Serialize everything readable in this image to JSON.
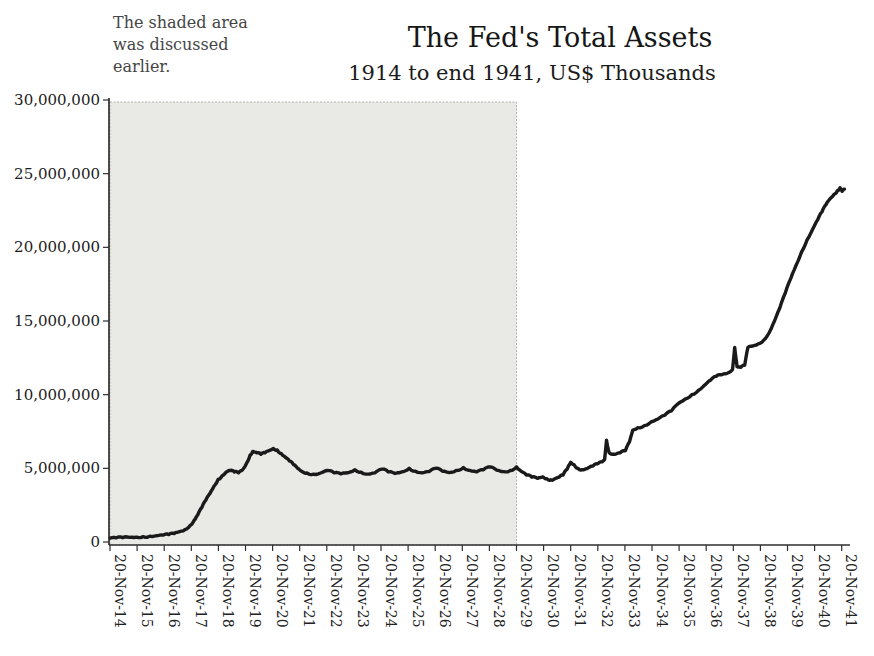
{
  "title": "The Fed's Total Assets",
  "subtitle": "1914 to end 1941, US$ Thousands",
  "annotation": {
    "lines": [
      "The shaded area",
      "was discussed",
      "earlier."
    ]
  },
  "colors": {
    "line": "#1a1a1a",
    "axis": "#2e2e2e",
    "shade_fill": "#e9e9e5",
    "shade_border": "#b3b3ad",
    "background": "#ffffff"
  },
  "chart_data": {
    "type": "line",
    "title": "The Fed's Total Assets",
    "subtitle": "1914 to end 1941, US$ Thousands",
    "xlabel": "",
    "ylabel": "US$ Thousands",
    "ylim": [
      0,
      30000000
    ],
    "y_tick_step": 5000000,
    "y_tick_labels": [
      "0",
      "5,000,000",
      "10,000,000",
      "15,000,000",
      "20,000,000",
      "25,000,000",
      "30,000,000"
    ],
    "x_tick_labels": [
      "20-Nov-14",
      "20-Nov-15",
      "20-Nov-16",
      "20-Nov-17",
      "20-Nov-18",
      "20-Nov-19",
      "20-Nov-20",
      "20-Nov-21",
      "20-Nov-22",
      "20-Nov-23",
      "20-Nov-24",
      "20-Nov-25",
      "20-Nov-26",
      "20-Nov-27",
      "20-Nov-28",
      "20-Nov-29",
      "20-Nov-30",
      "20-Nov-31",
      "20-Nov-32",
      "20-Nov-33",
      "20-Nov-34",
      "20-Nov-35",
      "20-Nov-36",
      "20-Nov-37",
      "20-Nov-38",
      "20-Nov-39",
      "20-Nov-40",
      "20-Nov-41"
    ],
    "x_start_year": 1914.88,
    "grid": false,
    "legend": "none",
    "shaded_region": {
      "from_label": "20-Nov-14",
      "to_label": "20-Nov-29",
      "note": "The shaded area was discussed earlier."
    },
    "series": [
      {
        "name": "Fed total assets (US$ thousands)",
        "points_year_value": [
          [
            1914.88,
            260000
          ],
          [
            1915.1,
            280000
          ],
          [
            1915.35,
            295000
          ],
          [
            1915.6,
            310000
          ],
          [
            1915.85,
            330000
          ],
          [
            1916.1,
            360000
          ],
          [
            1916.35,
            395000
          ],
          [
            1916.6,
            430000
          ],
          [
            1916.85,
            470000
          ],
          [
            1917.05,
            500000
          ],
          [
            1917.25,
            580000
          ],
          [
            1917.45,
            700000
          ],
          [
            1917.65,
            850000
          ],
          [
            1917.85,
            1150000
          ],
          [
            1917.98,
            1450000
          ],
          [
            1918.12,
            1850000
          ],
          [
            1918.27,
            2350000
          ],
          [
            1918.42,
            2850000
          ],
          [
            1918.57,
            3300000
          ],
          [
            1918.72,
            3800000
          ],
          [
            1918.87,
            4250000
          ],
          [
            1919.02,
            4500000
          ],
          [
            1919.17,
            4750000
          ],
          [
            1919.32,
            4850000
          ],
          [
            1919.47,
            4750000
          ],
          [
            1919.62,
            4700000
          ],
          [
            1919.77,
            4900000
          ],
          [
            1919.92,
            5350000
          ],
          [
            1920.05,
            5900000
          ],
          [
            1920.15,
            6150000
          ],
          [
            1920.3,
            6050000
          ],
          [
            1920.45,
            5950000
          ],
          [
            1920.6,
            6050000
          ],
          [
            1920.75,
            6200000
          ],
          [
            1920.9,
            6350000
          ],
          [
            1921.05,
            6250000
          ],
          [
            1921.2,
            6000000
          ],
          [
            1921.35,
            5750000
          ],
          [
            1921.5,
            5500000
          ],
          [
            1921.65,
            5250000
          ],
          [
            1921.8,
            5000000
          ],
          [
            1921.95,
            4800000
          ],
          [
            1922.15,
            4680000
          ],
          [
            1922.4,
            4600000
          ],
          [
            1922.65,
            4680000
          ],
          [
            1922.9,
            4850000
          ],
          [
            1923.15,
            4700000
          ],
          [
            1923.4,
            4620000
          ],
          [
            1923.65,
            4700000
          ],
          [
            1923.92,
            4900000
          ],
          [
            1924.15,
            4730000
          ],
          [
            1924.4,
            4610000
          ],
          [
            1924.65,
            4700000
          ],
          [
            1924.92,
            4950000
          ],
          [
            1925.15,
            4760000
          ],
          [
            1925.4,
            4650000
          ],
          [
            1925.65,
            4760000
          ],
          [
            1925.92,
            5000000
          ],
          [
            1926.15,
            4800000
          ],
          [
            1926.4,
            4690000
          ],
          [
            1926.65,
            4780000
          ],
          [
            1926.92,
            5000000
          ],
          [
            1927.15,
            4800000
          ],
          [
            1927.4,
            4710000
          ],
          [
            1927.65,
            4850000
          ],
          [
            1927.92,
            5050000
          ],
          [
            1928.15,
            4860000
          ],
          [
            1928.4,
            4760000
          ],
          [
            1928.65,
            4900000
          ],
          [
            1928.92,
            5100000
          ],
          [
            1929.15,
            4870000
          ],
          [
            1929.4,
            4780000
          ],
          [
            1929.65,
            4850000
          ],
          [
            1929.88,
            5100000
          ],
          [
            1930.05,
            4800000
          ],
          [
            1930.25,
            4550000
          ],
          [
            1930.45,
            4400000
          ],
          [
            1930.65,
            4320000
          ],
          [
            1930.85,
            4420000
          ],
          [
            1931.0,
            4300000
          ],
          [
            1931.15,
            4220000
          ],
          [
            1931.3,
            4300000
          ],
          [
            1931.45,
            4400000
          ],
          [
            1931.6,
            4550000
          ],
          [
            1931.75,
            4950000
          ],
          [
            1931.88,
            5400000
          ],
          [
            1932.0,
            5250000
          ],
          [
            1932.15,
            5000000
          ],
          [
            1932.3,
            4900000
          ],
          [
            1932.5,
            5000000
          ],
          [
            1932.7,
            5150000
          ],
          [
            1932.88,
            5300000
          ],
          [
            1933.05,
            5450000
          ],
          [
            1933.13,
            5600000
          ],
          [
            1933.2,
            6900000
          ],
          [
            1933.3,
            6050000
          ],
          [
            1933.5,
            5950000
          ],
          [
            1933.7,
            6050000
          ],
          [
            1933.9,
            6200000
          ],
          [
            1934.05,
            6800000
          ],
          [
            1934.17,
            7600000
          ],
          [
            1934.35,
            7750000
          ],
          [
            1934.6,
            7900000
          ],
          [
            1934.85,
            8150000
          ],
          [
            1935.1,
            8350000
          ],
          [
            1935.35,
            8600000
          ],
          [
            1935.6,
            8900000
          ],
          [
            1935.85,
            9400000
          ],
          [
            1936.1,
            9700000
          ],
          [
            1936.35,
            10000000
          ],
          [
            1936.6,
            10300000
          ],
          [
            1936.85,
            10700000
          ],
          [
            1937.05,
            11000000
          ],
          [
            1937.25,
            11250000
          ],
          [
            1937.45,
            11350000
          ],
          [
            1937.65,
            11450000
          ],
          [
            1937.85,
            11700000
          ],
          [
            1937.93,
            13200000
          ],
          [
            1938.02,
            11900000
          ],
          [
            1938.15,
            11850000
          ],
          [
            1938.3,
            12000000
          ],
          [
            1938.42,
            13200000
          ],
          [
            1938.6,
            13300000
          ],
          [
            1938.8,
            13450000
          ],
          [
            1939.0,
            13700000
          ],
          [
            1939.2,
            14200000
          ],
          [
            1939.4,
            15000000
          ],
          [
            1939.6,
            15900000
          ],
          [
            1939.8,
            16900000
          ],
          [
            1940.0,
            17900000
          ],
          [
            1940.2,
            18800000
          ],
          [
            1940.4,
            19700000
          ],
          [
            1940.6,
            20500000
          ],
          [
            1940.8,
            21200000
          ],
          [
            1941.0,
            21900000
          ],
          [
            1941.15,
            22400000
          ],
          [
            1941.3,
            22900000
          ],
          [
            1941.45,
            23300000
          ],
          [
            1941.6,
            23600000
          ],
          [
            1941.72,
            23850000
          ],
          [
            1941.82,
            24050000
          ],
          [
            1941.9,
            23800000
          ],
          [
            1941.98,
            23950000
          ]
        ]
      }
    ]
  }
}
